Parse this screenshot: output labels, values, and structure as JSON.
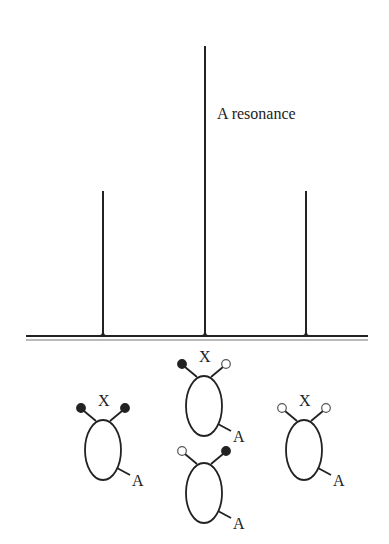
{
  "spectrum": {
    "label": "A resonance",
    "baseline": {
      "x1": 26,
      "x2": 368,
      "y": 336,
      "y2": 340
    },
    "peaks": [
      {
        "x": 103,
        "top": 191
      },
      {
        "x": 205,
        "top": 46
      },
      {
        "x": 306,
        "top": 191
      }
    ]
  },
  "molecules": [
    {
      "id": "left",
      "cx": 103,
      "cy": 450,
      "spins": [
        "filled",
        "filled"
      ],
      "x_label": "X",
      "a_label": "A"
    },
    {
      "id": "center-top",
      "cx": 204,
      "cy": 406,
      "spins": [
        "filled",
        "open"
      ],
      "x_label": "X",
      "a_label": "A"
    },
    {
      "id": "center-bottom",
      "cx": 204,
      "cy": 493,
      "spins": [
        "open",
        "filled"
      ],
      "x_label": "",
      "a_label": "A"
    },
    {
      "id": "right",
      "cx": 304,
      "cy": 450,
      "spins": [
        "open",
        "open"
      ],
      "x_label": "X",
      "a_label": "A"
    }
  ],
  "colors": {
    "ink": "#222222",
    "paper": "#ffffff"
  }
}
